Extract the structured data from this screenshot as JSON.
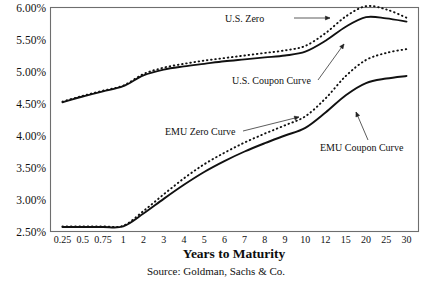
{
  "chart_data": {
    "type": "line",
    "title": "",
    "xlabel": "Years to Maturity",
    "ylabel": "",
    "source": "Source: Goldman, Sachs & Co.",
    "categories": [
      "0.25",
      "0.5",
      "0.75",
      "1",
      "2",
      "3",
      "4",
      "5",
      "6",
      "7",
      "8",
      "9",
      "10",
      "12",
      "15",
      "20",
      "25",
      "30"
    ],
    "ylim": [
      2.5,
      6.0
    ],
    "yticks": [
      "2.50%",
      "3.00%",
      "3.50%",
      "4.00%",
      "4.50%",
      "5.00%",
      "5.50%",
      "6.00%"
    ],
    "ytick_values": [
      2.5,
      3.0,
      3.5,
      4.0,
      4.5,
      5.0,
      5.5,
      6.0
    ],
    "grid": false,
    "legend_position": "inline-annotations",
    "series": [
      {
        "name": "U.S. Zero",
        "style": "dotted",
        "values": [
          4.53,
          4.62,
          4.7,
          4.78,
          4.96,
          5.06,
          5.12,
          5.17,
          5.21,
          5.25,
          5.29,
          5.33,
          5.4,
          5.6,
          5.86,
          6.02,
          5.97,
          5.84
        ]
      },
      {
        "name": "U.S. Coupon Curve",
        "style": "solid",
        "values": [
          4.52,
          4.61,
          4.69,
          4.77,
          4.94,
          5.03,
          5.08,
          5.12,
          5.16,
          5.19,
          5.22,
          5.25,
          5.31,
          5.48,
          5.7,
          5.85,
          5.83,
          5.78
        ]
      },
      {
        "name": "EMU Zero Curve",
        "style": "dotted",
        "values": [
          2.58,
          2.58,
          2.58,
          2.59,
          2.82,
          3.08,
          3.33,
          3.55,
          3.73,
          3.89,
          4.03,
          4.16,
          4.3,
          4.58,
          4.93,
          5.18,
          5.29,
          5.35
        ]
      },
      {
        "name": "EMU Coupon Curve",
        "style": "solid",
        "values": [
          2.57,
          2.57,
          2.57,
          2.58,
          2.78,
          3.01,
          3.23,
          3.43,
          3.6,
          3.75,
          3.88,
          4.0,
          4.12,
          4.36,
          4.63,
          4.82,
          4.89,
          4.93
        ]
      }
    ],
    "annotations": [
      {
        "id": "us-zero",
        "text": "U.S. Zero",
        "x": 225,
        "y": 22,
        "arrow": {
          "x1": 294,
          "y1": 18,
          "x2": 330,
          "y2": 18,
          "head": "right"
        }
      },
      {
        "id": "us-coupon",
        "text": "U.S. Coupon Curve",
        "x": 232,
        "y": 84,
        "arrow": {
          "x1": 318,
          "y1": 80,
          "x2": 344,
          "y2": 44,
          "head": "up"
        }
      },
      {
        "id": "emu-zero",
        "text": "EMU Zero Curve",
        "x": 165,
        "y": 135,
        "arrow": {
          "x1": 243,
          "y1": 131,
          "x2": 299,
          "y2": 117,
          "head": "right"
        }
      },
      {
        "id": "emu-coupon",
        "text": "EMU Coupon Curve",
        "x": 320,
        "y": 151,
        "arrow": {
          "x1": 368,
          "y1": 140,
          "x2": 356,
          "y2": 112,
          "head": "up"
        }
      }
    ]
  }
}
